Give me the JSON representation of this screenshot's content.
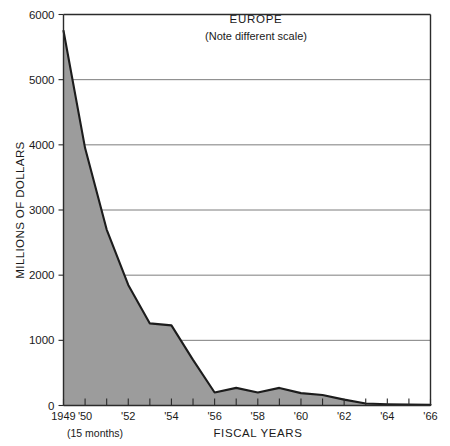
{
  "chart_data": {
    "type": "area",
    "title": "EUROPE",
    "subtitle": "(Note different scale)",
    "xlabel": "FISCAL YEARS",
    "ylabel": "MILLIONS OF DOLLARS",
    "footnote": "(15 months)",
    "grid": true,
    "legend": "none",
    "xlim": [
      1949,
      1966
    ],
    "ylim": [
      0,
      6000
    ],
    "y_ticks": [
      0,
      1000,
      2000,
      3000,
      4000,
      5000,
      6000
    ],
    "y_tick_labels": [
      "0",
      "1000",
      "2000",
      "3000",
      "4000",
      "5000",
      "6000"
    ],
    "x_ticks": [
      1949,
      1950,
      1951,
      1952,
      1953,
      1954,
      1955,
      1956,
      1957,
      1958,
      1959,
      1960,
      1961,
      1962,
      1963,
      1964,
      1965,
      1966
    ],
    "x_tick_labels": [
      "1949",
      "'50",
      "",
      "'52",
      "",
      "'54",
      "",
      "'56",
      "",
      "'58",
      "",
      "'60",
      "",
      "'62",
      "",
      "'64",
      "",
      "'66"
    ],
    "x": [
      1949,
      1950,
      1951,
      1952,
      1953,
      1954,
      1955,
      1956,
      1957,
      1958,
      1959,
      1960,
      1961,
      1962,
      1963,
      1964,
      1965,
      1966
    ],
    "values": [
      5750,
      3950,
      2700,
      1850,
      1260,
      1230,
      700,
      200,
      270,
      200,
      270,
      190,
      160,
      90,
      30,
      20,
      15,
      10
    ],
    "series": [
      {
        "name": "Europe aid",
        "values": [
          5750,
          3950,
          2700,
          1850,
          1260,
          1230,
          700,
          200,
          270,
          200,
          270,
          190,
          160,
          90,
          30,
          20,
          15,
          10
        ]
      }
    ],
    "colors": {
      "area": "#9c9c9c",
      "line": "#1c1c1c",
      "grid": "#6e6e6e",
      "axis": "#2b2b2b"
    }
  }
}
